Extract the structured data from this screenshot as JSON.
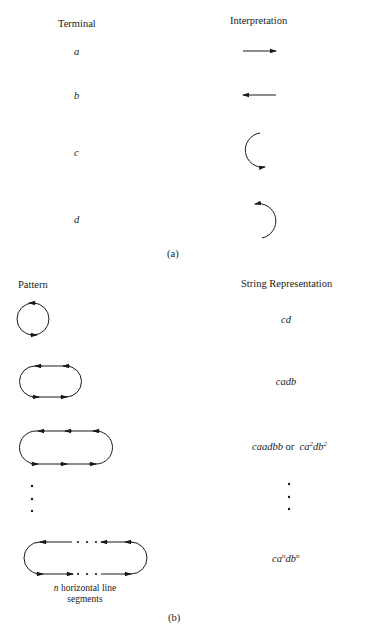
{
  "panel_a": {
    "headers": {
      "terminal": "Terminal",
      "interpretation": "Interpretation"
    },
    "terminals": [
      {
        "symbol": "a",
        "interpretation": "right-arrow (horizontal line segment, left to right)"
      },
      {
        "symbol": "b",
        "interpretation": "left-arrow (horizontal line segment, right to left)"
      },
      {
        "symbol": "c",
        "interpretation": "left semicircle arc, counterclockwise, arrow at bottom"
      },
      {
        "symbol": "d",
        "interpretation": "right semicircle arc, counterclockwise, arrow at top"
      }
    ],
    "label": "(a)"
  },
  "panel_b": {
    "headers": {
      "pattern": "Pattern",
      "string": "String Representation"
    },
    "rows": [
      {
        "pattern": "circle",
        "string": "cd"
      },
      {
        "pattern": "stadium with 1 horizontal segment",
        "string": "cadb"
      },
      {
        "pattern": "stadium with 2 horizontal segments",
        "string_plain": "caadbb",
        "or": "or",
        "string_exp": {
          "base1": "ca",
          "exp1": "2",
          "base2": "db",
          "exp2": "2"
        }
      },
      {
        "pattern": "ellipsis",
        "string": "⋮"
      },
      {
        "pattern": "stadium with n horizontal segments",
        "string_exp": {
          "base1": "ca",
          "exp1": "n",
          "base2": "db",
          "exp2": "n"
        }
      }
    ],
    "caption_var": "n",
    "caption_line1": " horizontal line",
    "caption_line2": "segments",
    "label": "(b)"
  },
  "colors": {
    "ink": "#1a1a1a",
    "background": "#ffffff"
  }
}
